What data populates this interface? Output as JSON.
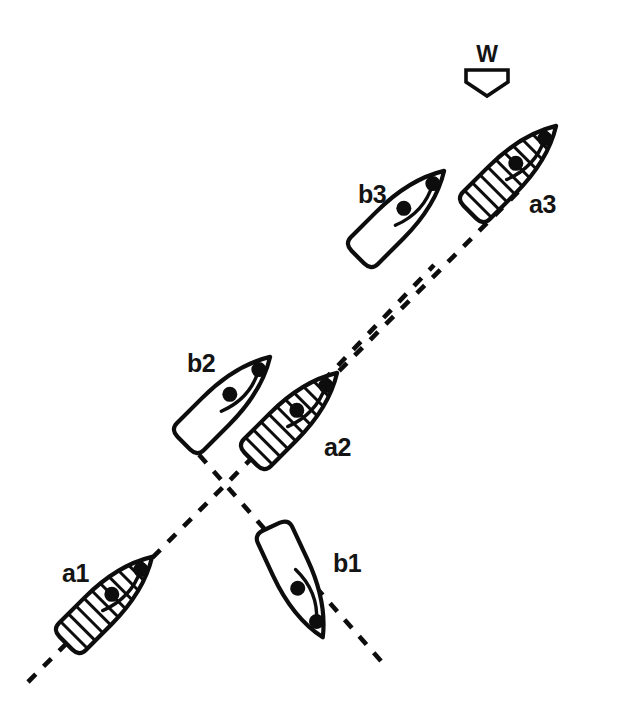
{
  "diagram": {
    "background_color": "#ffffff",
    "ink_color": "#0d0d0d",
    "wind": {
      "label": "W",
      "direction": "down",
      "icon": "wind-arrow-icon",
      "label_x": 487,
      "label_y": 62,
      "arrow_cx": 487,
      "arrow_top_y": 66
    },
    "tracks": [
      {
        "name": "track-a",
        "style": "dashed",
        "from": [
          28,
          682
        ],
        "to": [
          524,
          186
        ],
        "description": "dashed track line of boat a from lower-left to upper-right"
      },
      {
        "name": "track-b",
        "style": "dashed",
        "from": [
          381,
          661
        ],
        "to": [
          186,
          440
        ],
        "description": "dashed track line of boat b lower segment from lower-right to crossing point"
      },
      {
        "name": "track-b-upper",
        "style": "dashed",
        "from": [
          262,
          445
        ],
        "to": [
          434,
          265
        ],
        "description": "dashed track line of boat b upper segment continuing to b3"
      }
    ],
    "crossing_point": [
      221,
      481
    ],
    "boats": [
      {
        "id": "a1",
        "label": "a1",
        "fill": "hatched",
        "heading_deg": 45,
        "cx": 109,
        "cy": 600,
        "length": 122,
        "beam": 38,
        "label_x": 62,
        "label_y": 582
      },
      {
        "id": "b1",
        "label": "b1",
        "fill": "white",
        "heading_deg": 155,
        "cx": 297,
        "cy": 582,
        "length": 126,
        "beam": 40,
        "label_x": 333,
        "label_y": 572
      },
      {
        "id": "a2",
        "label": "a2",
        "fill": "hatched",
        "heading_deg": 45,
        "cx": 294,
        "cy": 416,
        "length": 120,
        "beam": 38,
        "label_x": 324,
        "label_y": 456
      },
      {
        "id": "b2",
        "label": "b2",
        "fill": "white",
        "heading_deg": 45,
        "cx": 227,
        "cy": 400,
        "length": 122,
        "beam": 40,
        "label_x": 187,
        "label_y": 372
      },
      {
        "id": "b3",
        "label": "b3",
        "fill": "white",
        "heading_deg": 45,
        "cx": 401,
        "cy": 214,
        "length": 122,
        "beam": 40,
        "label_x": 358,
        "label_y": 203
      },
      {
        "id": "a3",
        "label": "a3",
        "fill": "hatched",
        "heading_deg": 45,
        "cx": 513,
        "cy": 169,
        "length": 126,
        "beam": 38,
        "label_x": 529,
        "label_y": 213
      }
    ]
  }
}
